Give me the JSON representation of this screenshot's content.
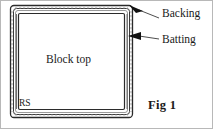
{
  "figure": {
    "caption": "Fig 1",
    "colors": {
      "ink": "#1a1a1a",
      "line": "#2b2b2b",
      "page_border": "#b8b8b8",
      "background": "#ffffff"
    },
    "labels": {
      "backing": "Backing",
      "batting": "Batting",
      "block_top": "Block top",
      "right_side": "RS"
    },
    "layers": [
      {
        "name": "backing",
        "label": "Backing",
        "order": 1
      },
      {
        "name": "batting",
        "label": "Batting",
        "order": 2
      },
      {
        "name": "block-top",
        "label": "Block top",
        "order": 3
      }
    ],
    "callouts": [
      {
        "name": "backing-callout",
        "label": "Backing",
        "target": "top-right-corner"
      },
      {
        "name": "batting-callout",
        "label": "Batting",
        "target": "right-edge"
      }
    ]
  }
}
